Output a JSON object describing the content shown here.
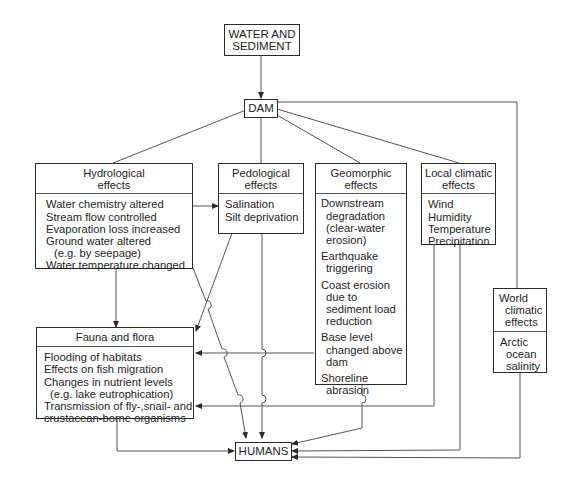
{
  "source": {
    "lines": [
      "WATER AND",
      "SEDIMENT"
    ]
  },
  "dam": {
    "label": "DAM"
  },
  "humans": {
    "label": "HUMANS"
  },
  "hydrological": {
    "title": [
      "Hydrological",
      "effects"
    ],
    "items": [
      "Water chemistry altered",
      "Stream flow controlled",
      "Evaporation loss increased",
      "Ground water altered",
      "(e.g. by seepage)",
      "Water temperature changed"
    ]
  },
  "pedological": {
    "title": [
      "Pedological",
      "effects"
    ],
    "items": [
      "Salination",
      "Silt deprivation"
    ]
  },
  "geomorphic": {
    "title": [
      "Geomorphic",
      "effects"
    ],
    "groups": [
      [
        "Downstream",
        "degradation",
        "(clear-water",
        "erosion)"
      ],
      [
        "Earthquake",
        "triggering"
      ],
      [
        "Coast erosion",
        "due to",
        "sediment load",
        "reduction"
      ],
      [
        "Base level",
        "changed above",
        "dam"
      ],
      [
        "Shoreline",
        "abrasion"
      ]
    ]
  },
  "local_climatic": {
    "title": [
      "Local climatic",
      "effects"
    ],
    "items": [
      "Wind",
      "Humidity",
      "Temperature",
      "Precipitation"
    ]
  },
  "world_climatic": {
    "title": [
      "World",
      "climatic",
      "effects"
    ],
    "items": [
      "Arctic",
      "ocean",
      "salinity"
    ]
  },
  "fauna_flora": {
    "title": "Fauna and flora",
    "items": [
      "Flooding of habitats",
      "Effects on fish migration",
      "Changes in nutrient levels",
      "(e.g. lake eutrophication)",
      "Transmission of fly-,snail- and",
      "crustacean-borne organisms"
    ]
  }
}
